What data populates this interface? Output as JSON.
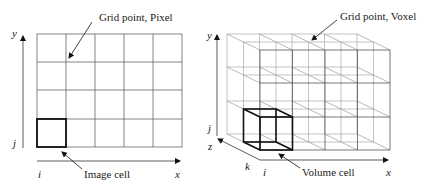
{
  "left_panel": {
    "title": "2D pixel grid",
    "callout_top": "Grid point, Pixel",
    "callout_bottom": "Image cell",
    "axis_y_label": "y",
    "axis_x_label": "x",
    "index_row_label": "j",
    "index_col_label": "i",
    "grid": {
      "columns": 5,
      "rows": 4
    }
  },
  "right_panel": {
    "title": "3D voxel grid",
    "callout_top": "Grid point, Voxel",
    "callout_bottom": "Volume cell",
    "axis_y_label": "y",
    "axis_x_label": "x",
    "axis_z_label": "z",
    "index_row_label": "j",
    "index_col_label": "i",
    "index_depth_label": "k",
    "grid": {
      "columns": 4,
      "rows": 3,
      "layers": 3
    }
  },
  "colors": {
    "grid_line": "#555555",
    "light_line": "#aaaaaa",
    "highlight": "#111111",
    "text": "#222222"
  }
}
